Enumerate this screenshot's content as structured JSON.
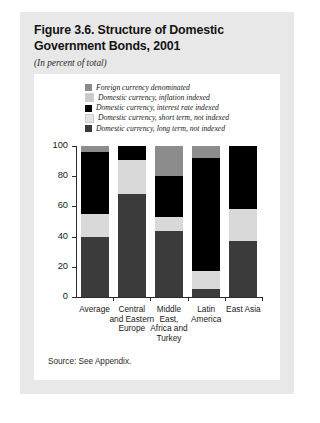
{
  "figure": {
    "title_line1": "Figure 3.6. Structure of Domestic",
    "title_line2": "Government Bonds, 2001",
    "subtitle": "(In percent of total)",
    "source": "Source: See Appendix."
  },
  "chart_data": {
    "type": "bar",
    "stacked": true,
    "title": "Figure 3.6. Structure of Domestic Government Bonds, 2001",
    "subtitle": "(In percent of total)",
    "xlabel": "",
    "ylabel": "",
    "ylim": [
      0,
      100
    ],
    "yticks": [
      0,
      20,
      40,
      60,
      80,
      100
    ],
    "ytick_labels": [
      "0",
      "20",
      "40",
      "60",
      "80",
      "100"
    ],
    "grid": false,
    "legend_position": "top",
    "categories": [
      "Average",
      "Central and Eastern Europe",
      "Middle East, Africa and Turkey",
      "Latin America",
      "East Asia"
    ],
    "category_label_lines": [
      [
        "Average"
      ],
      [
        "Central",
        "and Eastern",
        "Europe"
      ],
      [
        "Middle East,",
        "Africa and",
        "Turkey"
      ],
      [
        "Latin",
        "America"
      ],
      [
        "East Asia"
      ]
    ],
    "series": [
      {
        "name": "Domestic currency, long term, not indexed",
        "color": "#3b3b3b",
        "values": [
          40,
          68,
          44,
          5,
          37
        ]
      },
      {
        "name": "Domestic currency, short term, not indexed",
        "color": "#d9d9d9",
        "values": [
          15,
          23,
          9,
          12,
          21
        ]
      },
      {
        "name": "Domestic currency, interest rate indexed",
        "color": "#000000",
        "values": [
          41,
          9,
          27,
          75,
          42
        ]
      },
      {
        "name": "Domestic currency, inflation indexed",
        "color": "#c9c9c9",
        "values": [
          0,
          0,
          0,
          0,
          0
        ]
      },
      {
        "name": "Foreign currency denominated",
        "color": "#8c8c8c",
        "values": [
          4,
          0,
          20,
          8,
          0
        ]
      }
    ]
  },
  "legend": {
    "items": [
      {
        "label": "Foreign currency denominated",
        "color": "#8c8c8c"
      },
      {
        "label": "Domestic currency, inflation indexed",
        "color": "#c9c9c9"
      },
      {
        "label": "Domestic currency, interest rate indexed",
        "color": "#000000"
      },
      {
        "label": "Domestic currency, short term, not indexed",
        "color": "#e3e3e3"
      },
      {
        "label": "Domestic currency, long term, not indexed",
        "color": "#3b3b3b"
      }
    ]
  },
  "colors": {
    "card_background": "#e8e8e8",
    "panel_background": "#ffffff",
    "axis": "#2b2b2b",
    "text": "#1a1a1a"
  }
}
